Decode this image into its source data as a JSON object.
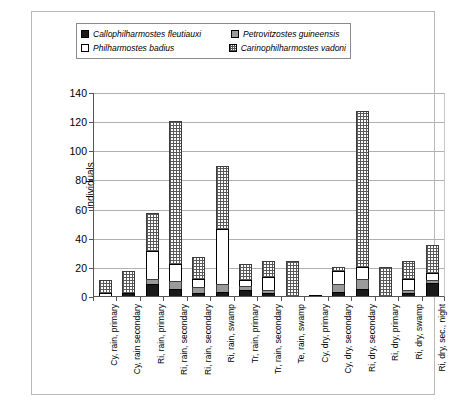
{
  "chart_data": {
    "type": "bar",
    "subtype": "stacked-bar",
    "title": "",
    "xlabel": "",
    "ylabel": "individuals",
    "ylim": [
      0,
      140
    ],
    "yticks": [
      0,
      20,
      40,
      60,
      80,
      100,
      120,
      140
    ],
    "grid": "horizontal",
    "legend_position": "top",
    "categories": [
      "Cy, rain, primary",
      "Cy, rain secondary",
      "Ri, rain, primary",
      "Ri, rain, secondary",
      "Ri, rain, secondary",
      "Ri, rain, swamp",
      "Tr, rain, primary",
      "Tr, rain, secondary",
      "Te, rain, swamp",
      "Cy, dry, primary",
      "Cy, dry, secondary",
      "Ri, dry, secondary",
      "Ri, dry, primary",
      "Ri, dry, swamp",
      "Ri, dry, sec., night"
    ],
    "series": [
      {
        "name": "Callophilharmostes fleutiauxi",
        "fill": "solid-black",
        "color": "#1a1a1a",
        "values": [
          0,
          2,
          8,
          5,
          2,
          3,
          4,
          2,
          0,
          0,
          3,
          5,
          0,
          2,
          9
        ]
      },
      {
        "name": "Petrovitzostes guineensis",
        "fill": "solid-gray",
        "color": "#9a9a9a",
        "values": [
          0,
          0,
          4,
          5,
          4,
          5,
          3,
          2,
          0,
          0,
          5,
          7,
          0,
          2,
          2
        ]
      },
      {
        "name": "Philharmostes badius",
        "fill": "white",
        "color": "#ffffff",
        "values": [
          2,
          0,
          19,
          12,
          6,
          38,
          4,
          9,
          0,
          1,
          9,
          8,
          0,
          8,
          5
        ]
      },
      {
        "name": "Carinophilharmostes vadoni",
        "fill": "crosshatch",
        "color": "#595959",
        "values": [
          9,
          15,
          26,
          98,
          15,
          43,
          11,
          11,
          24,
          0,
          3,
          107,
          20,
          12,
          19
        ]
      }
    ],
    "totals": [
      11,
      17,
      57,
      120,
      27,
      89,
      22,
      24,
      24,
      1,
      20,
      127,
      20,
      24,
      35
    ]
  },
  "legend": {
    "entries": [
      {
        "label": "Callophilharmostes fleutiauxi",
        "swatch": "solid-black-swatch"
      },
      {
        "label": "Petrovitzostes guineensis",
        "swatch": "solid-gray-swatch"
      },
      {
        "label": "Philharmostes badius",
        "swatch": "white-swatch"
      },
      {
        "label": "Carinophilharmostes vadoni",
        "swatch": "crosshatch-swatch"
      }
    ]
  },
  "axis": {
    "y_title": "individuals",
    "y_tick_labels": [
      "140",
      "120",
      "100",
      "80",
      "60",
      "40",
      "20",
      "0"
    ]
  }
}
